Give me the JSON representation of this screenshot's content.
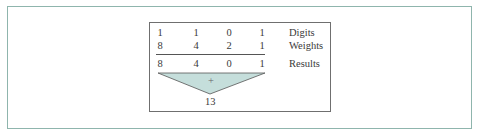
{
  "figure": {
    "rows": [
      {
        "label": "Digits",
        "values": [
          "1",
          "1",
          "0",
          "1"
        ]
      },
      {
        "label": "Weights",
        "values": [
          "8",
          "4",
          "2",
          "1"
        ]
      },
      {
        "label": "Results",
        "values": [
          "8",
          "4",
          "0",
          "1"
        ]
      }
    ],
    "operator": "+",
    "total": "13",
    "colors": {
      "outer_border": "#8fb5ad",
      "inner_border": "#6f6f6f",
      "triangle_fill": "#c5dedb"
    }
  }
}
